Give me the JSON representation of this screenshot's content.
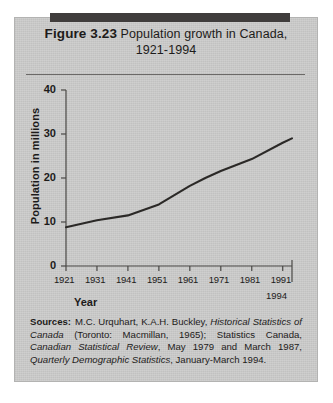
{
  "figure": {
    "label": "Figure 3.23",
    "caption": "Population growth in Canada,",
    "years": "1921-1994",
    "panel_color": "#c8c8c7",
    "header_bar_color": "#403d3c",
    "text_color": "#1d1b1a"
  },
  "chart_data": {
    "type": "line",
    "title": "Figure 3.23 Population growth in Canada, 1921-1994",
    "xlabel": "Year",
    "ylabel": "Population in millions",
    "x": [
      1921,
      1931,
      1941,
      1951,
      1961,
      1966,
      1971,
      1981,
      1991,
      1994
    ],
    "values": [
      8.8,
      10.4,
      11.5,
      14.0,
      18.2,
      20.0,
      21.6,
      24.3,
      28.0,
      29.0
    ],
    "xlim": [
      1921,
      1994
    ],
    "ylim": [
      0,
      40
    ],
    "xticks": [
      1921,
      1931,
      1941,
      1951,
      1961,
      1971,
      1981,
      1991
    ],
    "xtick_labels": [
      "1921",
      "1931",
      "1941",
      "1951",
      "1961",
      "1971",
      "1981",
      "1991"
    ],
    "x_end_label": "1994",
    "yticks": [
      0,
      10,
      20,
      30,
      40
    ],
    "ytick_labels": [
      "0",
      "10",
      "20",
      "30",
      "40"
    ],
    "grid": false,
    "legend": null,
    "line_color": "#2b2927",
    "series": [
      {
        "name": "Population of Canada",
        "x": [
          1921,
          1931,
          1941,
          1951,
          1961,
          1966,
          1971,
          1981,
          1991,
          1994
        ],
        "values": [
          8.8,
          10.4,
          11.5,
          14.0,
          18.2,
          20.0,
          21.6,
          24.3,
          28.0,
          29.0
        ]
      }
    ]
  },
  "sources": {
    "label": "Sources:",
    "text": "M.C. Urquhart, K.A.H. Buckley, Historical Statistics of Canada (Toronto: Macmillan, 1965); Statistics Canada, Canadian Statistical Review, May 1979 and March 1987, Quarterly Demographic Statistics, January-March 1994.",
    "italic_titles": [
      "Historical Statistics of Canada",
      "Canadian Statistical Review",
      "Quarterly Demographic Statistics"
    ]
  }
}
